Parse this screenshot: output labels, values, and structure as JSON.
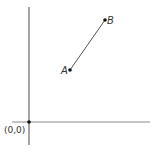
{
  "diagram": {
    "title": "",
    "colors": {
      "axis": "#8a8a8a",
      "segment": "#555555",
      "point": "#111111",
      "label": "#333333",
      "background": "#ffffff"
    },
    "origin": {
      "label": "(0,0)",
      "px": [
        29,
        122
      ]
    },
    "axes": {
      "x": {
        "from": [
          12,
          122
        ],
        "to": [
          150,
          122
        ]
      },
      "y": {
        "from": [
          29,
          7
        ],
        "to": [
          29,
          145
        ]
      }
    },
    "points": [
      {
        "id": "A",
        "label": "A",
        "px": [
          70,
          70
        ]
      },
      {
        "id": "B",
        "label": "B",
        "px": [
          105,
          20
        ]
      }
    ],
    "segments": [
      {
        "from": "A",
        "to": "B"
      }
    ]
  }
}
